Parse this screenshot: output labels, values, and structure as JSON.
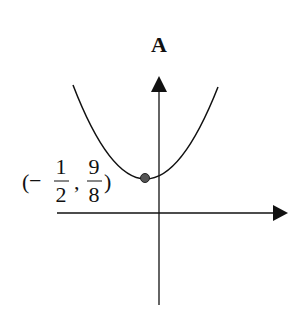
{
  "figure": {
    "title": "A",
    "vertex_label": {
      "open_paren": "(",
      "minus": "−",
      "x_num": "1",
      "x_den": "2",
      "comma": ",",
      "y_num": "9",
      "y_den": "8",
      "close_paren": ")"
    },
    "vertex": {
      "x": -0.5,
      "y": 1.125
    },
    "curve": "upward-opening parabola",
    "colors": {
      "stroke": "#111111",
      "point_fill": "#555555"
    }
  }
}
